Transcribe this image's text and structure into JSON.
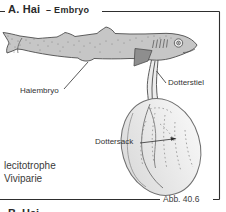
{
  "figure": {
    "panel_title": "A. Hai",
    "panel_subtitle": "– Embryo",
    "caption_line1": "lecitotrophe",
    "caption_line2": "Viviparie",
    "figure_ref": "Abb. 40.6",
    "next_panel_partial_title": "B. Hai"
  },
  "labels": {
    "embryo": "Haiembryo",
    "yolk_stalk": "Dotterstiel",
    "yolk_sac": "Dottersack"
  },
  "colors": {
    "frame": "#2e2e2e",
    "text": "#2a2a2a",
    "leader": "#2e2e2e",
    "shark_fill": "#c6c6c6",
    "shark_outline": "#4d4d4d",
    "speckle": "#7b7b7b",
    "fin_fill": "#8e8e8e",
    "stalk_fill": "#ececec",
    "sac_fill_dark": "#dcdcdc",
    "sac_fill_light": "#f6f6f6",
    "sac_outline": "#6f6f6f",
    "vessel_solid": "#707070",
    "vessel_dashed": "#8f8f8f"
  }
}
